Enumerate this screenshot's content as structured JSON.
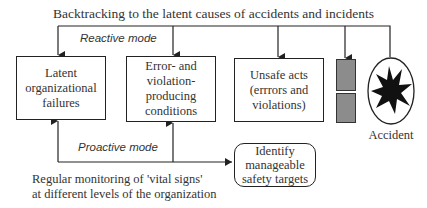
{
  "diagram": {
    "title": "Backtracking to the latent causes of accidents and incidents",
    "reactive_label": "Reactive mode",
    "proactive_label": "Proactive mode",
    "boxes": [
      {
        "id": "latent",
        "label": "Latent\norganizational\nfailures"
      },
      {
        "id": "error",
        "label": "Error- and\nviolation-\nproducing\nconditions"
      },
      {
        "id": "unsafe",
        "label": "Unsafe acts\n(errrors and\nviolations)"
      }
    ],
    "defenses": {
      "label": "defences",
      "count": 2,
      "color": "#8c8c8c"
    },
    "accident": {
      "label": "Accident"
    },
    "target_box": {
      "label": "Identify\nmanageable\nsafety targets"
    },
    "monitoring_caption": "Regular monitoring of  'vital signs'\nat different levels of the organization",
    "colors": {
      "line": "#222222",
      "gray_block": "#8c8c8c"
    }
  }
}
